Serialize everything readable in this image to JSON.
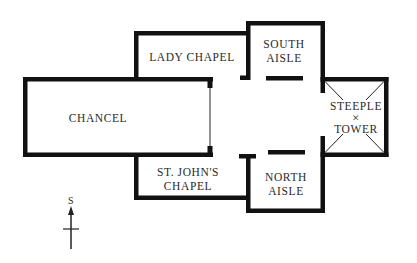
{
  "diagram": {
    "type": "church-floor-plan",
    "colors": {
      "wall": "#111111",
      "background": "#ffffff",
      "text": "#2a2a2a"
    },
    "rooms": [
      {
        "id": "chancel",
        "label": "CHANCEL"
      },
      {
        "id": "lady-chapel",
        "label": "LADY CHAPEL"
      },
      {
        "id": "south-aisle",
        "label_lines": [
          "SOUTH",
          "AISLE"
        ]
      },
      {
        "id": "steeple-tower",
        "label_lines": [
          "STEEPLE",
          "TOWER"
        ],
        "center_mark": "×"
      },
      {
        "id": "north-aisle",
        "label_lines": [
          "NORTH",
          "AISLE"
        ]
      },
      {
        "id": "st-johns-chapel",
        "label_lines": [
          "ST. JOHN'S",
          "CHAPEL"
        ]
      }
    ],
    "compass": {
      "label": "S"
    }
  }
}
